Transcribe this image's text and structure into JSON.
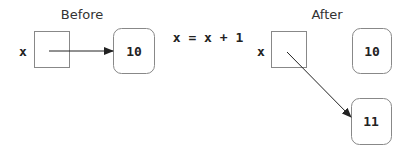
{
  "before": {
    "title": "Before",
    "var_label": "x",
    "value": "10"
  },
  "statement": "x = x + 1",
  "after": {
    "title": "After",
    "var_label": "x",
    "old_value": "10",
    "new_value": "11"
  },
  "colors": {
    "stroke": "#888888",
    "arrow": "#222222",
    "text": "#333333"
  }
}
